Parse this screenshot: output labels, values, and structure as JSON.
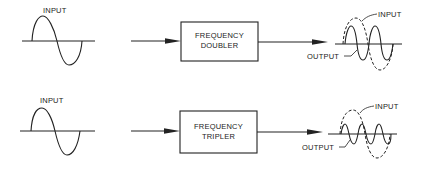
{
  "diagram": {
    "colors": {
      "line": "#222222",
      "background": "#ffffff"
    },
    "rows": [
      {
        "id": "doubler",
        "input_label": "INPUT",
        "block": {
          "line1": "FREQUENCY",
          "line2": "DOUBLER"
        },
        "output_input_label": "INPUT",
        "output_label": "OUTPUT",
        "input_cycles": 1,
        "output_cycles": 2
      },
      {
        "id": "tripler",
        "input_label": "INPUT",
        "block": {
          "line1": "FREQUENCY",
          "line2": "TRIPLER"
        },
        "output_input_label": "INPUT",
        "output_label": "OUTPUT",
        "input_cycles": 1,
        "output_cycles": 3
      }
    ]
  }
}
